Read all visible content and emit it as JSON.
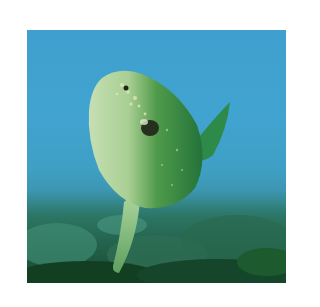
{
  "photo": {
    "subject": "ocean sunfish (mola) swimming above seaweed-covered seabed",
    "colors": {
      "water": "#41a3cf",
      "fish_belly": "#b9d6a8",
      "fish_back": "#2f8a3c",
      "seabed": "#2a6c5a",
      "seaweed_dark": "#123f22"
    }
  }
}
